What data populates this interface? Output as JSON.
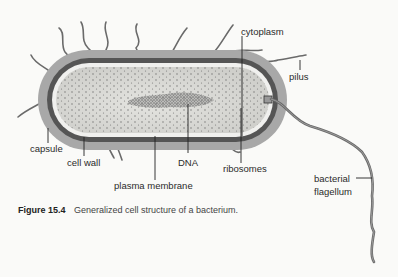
{
  "figure": {
    "number": "Figure 15.4",
    "caption": "Generalized cell structure of a bacterium."
  },
  "labels": {
    "cytoplasm": "cytoplasm",
    "pilus": "pilus",
    "capsule": "capsule",
    "cell_wall": "cell wall",
    "dna": "DNA",
    "ribosomes": "ribosomes",
    "plasma_membrane": "plasma membrane",
    "flagellum_line1": "bacterial",
    "flagellum_line2": "flagellum"
  },
  "colors": {
    "background": "#fafaf8",
    "capsule": "#a8a8a8",
    "cell_wall": "#555555",
    "membrane": "#f0f0ee",
    "cytoplasm": "#dcdcd8",
    "dna": "#707070",
    "pili": "#6a6a6a",
    "leader_lines": "#222222"
  }
}
